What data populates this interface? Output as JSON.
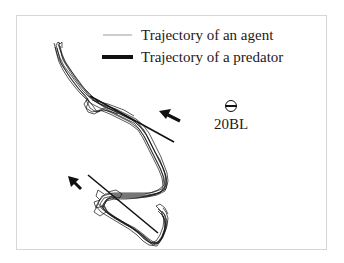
{
  "figure": {
    "legend": {
      "items": [
        {
          "label": "Trajectory of an agent",
          "style": "thin-line",
          "color": "#9a9a9a"
        },
        {
          "label": "Trajectory of a predator",
          "style": "thick-line",
          "color": "#111111"
        }
      ]
    },
    "scale_bar": {
      "label": "20BL",
      "icon": "circle-with-bar-icon"
    },
    "arrows": [
      {
        "name": "upper-attack-arrow",
        "direction": "up-left"
      },
      {
        "name": "lower-attack-arrow",
        "direction": "up-left"
      }
    ],
    "predator_paths": [
      {
        "name": "upper-predator-path",
        "from": [
          90,
          95
        ],
        "to": [
          174,
          142
        ]
      },
      {
        "name": "lower-predator-path",
        "from": [
          88,
          175
        ],
        "to": [
          158,
          233
        ]
      }
    ],
    "colors": {
      "frame": "#d6d6d6",
      "trajectory": "#111111",
      "text": "#1a1a1a"
    }
  }
}
